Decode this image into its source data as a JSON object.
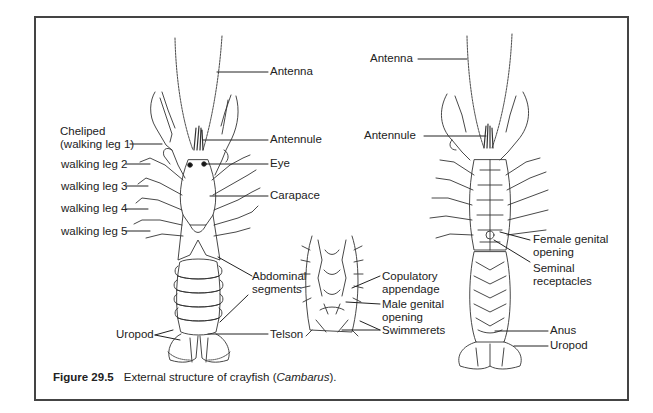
{
  "figure": {
    "number": "Figure 29.5",
    "caption_prefix": "External structure of crayfish (",
    "caption_genus": "Cambarus",
    "caption_suffix": ")."
  },
  "dorsal_view": {
    "labels": {
      "antenna": "Antenna",
      "antennule": "Antennule",
      "eye": "Eye",
      "carapace": "Carapace",
      "cheliped_line1": "Cheliped",
      "cheliped_line2": "(walking leg 1)",
      "walking_leg_2": "walking leg 2",
      "walking_leg_3": "walking leg 3",
      "walking_leg_4": "walking leg 4",
      "walking_leg_5": "walking leg 5",
      "abdominal_line1": "Abdominal",
      "abdominal_line2": "segments",
      "uropod": "Uropod",
      "telson": "Telson"
    }
  },
  "male_detail": {
    "labels": {
      "copulatory_line1": "Copulatory",
      "copulatory_line2": "appendage",
      "male_genital_line1": "Male genital",
      "male_genital_line2": "opening",
      "swimmerets": "Swimmerets"
    }
  },
  "ventral_view": {
    "labels": {
      "antenna": "Antenna",
      "antennule": "Antennule",
      "female_genital_line1": "Female genital",
      "female_genital_line2": "opening",
      "seminal_line1": "Seminal",
      "seminal_line2": "receptacles",
      "anus": "Anus",
      "uropod": "Uropod"
    }
  },
  "colors": {
    "ink": "#222222",
    "frame": "#444444",
    "background": "#ffffff"
  }
}
